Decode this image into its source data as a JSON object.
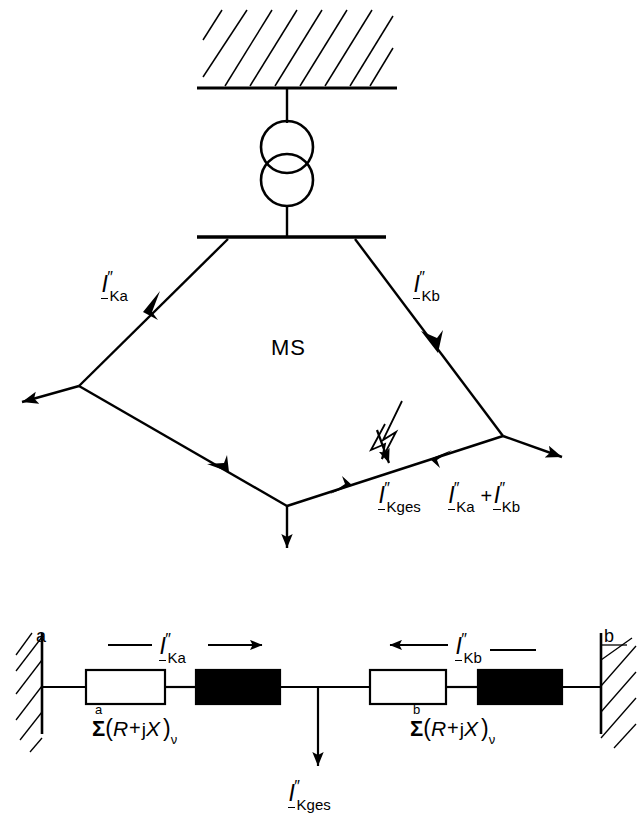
{
  "figure": {
    "stroke_color": "#000000",
    "background_color": "#ffffff",
    "fill_black": "#000000",
    "fill_white": "#ffffff"
  },
  "upper_diagram": {
    "name": "network-single-line-diagram",
    "network_label": "MS",
    "transformer": {
      "windings": 2,
      "symbol": "two-overlapping-circles"
    },
    "source_wall": {
      "symbol": "hatched-infinite-bus"
    },
    "fault_symbol": "lightning-bolt-arrow",
    "branch_labels": [
      {
        "id": "left-branch",
        "I": "I",
        "primes": "″",
        "sub": "Ka"
      },
      {
        "id": "right-branch",
        "I": "I",
        "primes": "″",
        "sub": "Kb"
      }
    ],
    "fault_equation": {
      "total": {
        "I": "I",
        "primes": "″",
        "sub": "Kges"
      },
      "term_a": {
        "I": "I",
        "primes": "″",
        "sub": "Ka"
      },
      "operator": "+",
      "term_b": {
        "I": "I",
        "primes": "″",
        "sub": "Kb"
      }
    }
  },
  "lower_diagram": {
    "name": "equivalent-circuit-diagram",
    "left_terminal_label": "a",
    "right_terminal_label": "b",
    "current_left": {
      "I": "I",
      "primes": "″",
      "sub": "Ka"
    },
    "current_right": {
      "I": "I",
      "primes": "″",
      "sub": "Kb"
    },
    "current_total": {
      "I": "I",
      "primes": "″",
      "sub": "Kges"
    },
    "impedance_left": {
      "sigma": "Σ",
      "limit": "a",
      "open_paren": "(",
      "resistance": "R",
      "operator": "+",
      "j": "j",
      "reactance": "X",
      "close_paren": ")",
      "index": "ν"
    },
    "impedance_right": {
      "sigma": "Σ",
      "limit": "b",
      "open_paren": "(",
      "resistance": "R",
      "operator": "+",
      "j": "j",
      "reactance": "X",
      "close_paren": ")",
      "index": "ν"
    },
    "elements": [
      {
        "id": "left-white-box",
        "style": "hollow-rectangle"
      },
      {
        "id": "left-black-box",
        "style": "filled-rectangle"
      },
      {
        "id": "right-white-box",
        "style": "hollow-rectangle"
      },
      {
        "id": "right-black-box",
        "style": "filled-rectangle"
      }
    ]
  }
}
